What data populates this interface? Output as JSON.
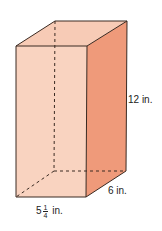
{
  "figure": {
    "type": "rectangular-prism",
    "colors": {
      "front_face": "#f9d3c0",
      "top_face": "#f7cbb6",
      "right_face": "#ef9a7a",
      "edge": "#3a2a22",
      "hidden_edge": "#3a2a22"
    }
  },
  "labels": {
    "height": "12 in.",
    "depth": "6 in.",
    "width_whole": "5",
    "width_num": "1",
    "width_den": "4",
    "width_unit": "in."
  }
}
